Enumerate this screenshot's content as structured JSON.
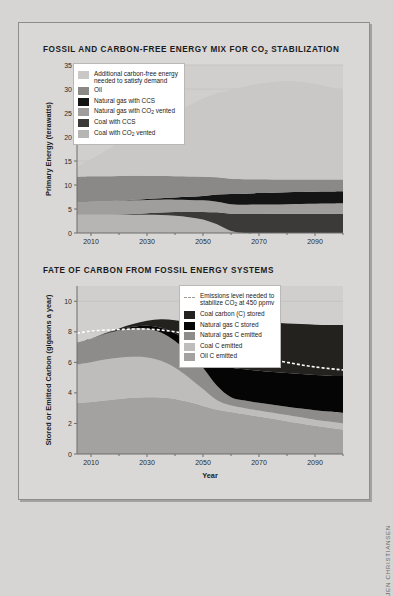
{
  "credit": "JEN CHRISTIANSEN",
  "panels": {
    "top": {
      "title_before": "FOSSIL AND CARBON-FREE ENERGY MIX FOR CO",
      "title_sub": "2",
      "title_after": " STABILIZATION"
    },
    "bottom": {
      "title_before": "FATE OF CARBON FROM FOSSIL ENERGY SYSTEMS",
      "title_sub": "",
      "title_after": ""
    }
  },
  "legend_top": [
    {
      "label_a": "Additional carbon-free energy",
      "label_b": "needed to satisfy demand",
      "color": "#c9c8c6",
      "type": "swatch"
    },
    {
      "label_a": "Oil",
      "label_b": "",
      "color": "#8a8987",
      "type": "swatch"
    },
    {
      "label_a": "Natural gas with CCS",
      "label_b": "",
      "color": "#141414",
      "type": "swatch"
    },
    {
      "label_a": "Natural gas with CO",
      "label_sub": "2",
      "label_a2": " vented",
      "label_b": "",
      "color": "#9f9e9c",
      "type": "swatch"
    },
    {
      "label_a": "Coal with CCS",
      "label_b": "",
      "color": "#3b3a38",
      "type": "swatch"
    },
    {
      "label_a": "Coal with CO",
      "label_sub": "2",
      "label_a2": " vented",
      "label_b": "",
      "color": "#b6b5b3",
      "type": "swatch"
    }
  ],
  "legend_bottom": [
    {
      "label_a": "Emissions level needed to",
      "label_b": "stabilize CO",
      "label_sub": "2",
      "label_b2": " at 450 ppmv",
      "color": "#9b9a98",
      "type": "dashline"
    },
    {
      "label_a": "Coal carbon (C) stored",
      "label_b": "",
      "color": "#23221f",
      "type": "swatch"
    },
    {
      "label_a": "Natural gas C stored",
      "label_b": "",
      "color": "#050505",
      "type": "swatch"
    },
    {
      "label_a": "Natural gas C emitted",
      "label_b": "",
      "color": "#8d8c8a",
      "type": "swatch"
    },
    {
      "label_a": "Coal C emitted",
      "label_b": "",
      "color": "#bebdbb",
      "type": "swatch"
    },
    {
      "label_a": "Oil C emitted",
      "label_b": "",
      "color": "#a3a2a0",
      "type": "swatch"
    }
  ],
  "chart_data": [
    {
      "id": "energy-mix",
      "type": "area",
      "title": "FOSSIL AND CARBON-FREE ENERGY MIX FOR CO2 STABILIZATION",
      "xlabel": "",
      "ylabel": "Primary Energy (terawatts)",
      "xlim": [
        2005,
        2100
      ],
      "ylim": [
        0,
        35
      ],
      "xticks": [
        2010,
        2030,
        2050,
        2070,
        2090
      ],
      "xminorticks": [
        2020,
        2040,
        2060,
        2080,
        2100
      ],
      "yticks": [
        0,
        5,
        10,
        15,
        20,
        25,
        30,
        35
      ],
      "grid": true,
      "legend_position": "upper-left",
      "stack_order": [
        "Coal with CO2 vented",
        "Coal with CCS",
        "Natural gas with CO2 vented",
        "Natural gas with CCS",
        "Oil",
        "Additional carbon-free energy needed to satisfy demand"
      ],
      "x": [
        2005,
        2010,
        2015,
        2020,
        2025,
        2030,
        2035,
        2040,
        2045,
        2050,
        2055,
        2060,
        2065,
        2070,
        2075,
        2080,
        2085,
        2090,
        2095,
        2100
      ],
      "series": [
        {
          "name": "Coal with CO2 vented",
          "color": "#b6b5b3",
          "values": [
            3.8,
            3.8,
            3.8,
            3.8,
            3.8,
            3.8,
            3.75,
            3.6,
            3.3,
            2.8,
            1.8,
            0.4,
            0.0,
            0.0,
            0.0,
            0.0,
            0.0,
            0.0,
            0.0,
            0.0
          ]
        },
        {
          "name": "Coal with CCS",
          "color": "#3b3a38",
          "values": [
            0.0,
            0.0,
            0.0,
            0.05,
            0.15,
            0.3,
            0.5,
            0.75,
            1.1,
            1.6,
            2.5,
            3.6,
            3.95,
            3.98,
            4.0,
            4.0,
            4.0,
            4.0,
            4.0,
            4.0
          ]
        },
        {
          "name": "Natural gas with CO2 vented",
          "color": "#9f9e9c",
          "values": [
            2.6,
            2.7,
            2.8,
            2.85,
            2.85,
            2.8,
            2.7,
            2.6,
            2.5,
            2.4,
            2.2,
            2.0,
            1.95,
            1.95,
            1.95,
            2.0,
            2.05,
            2.1,
            2.15,
            2.2
          ]
        },
        {
          "name": "Natural gas with CCS",
          "color": "#141414",
          "values": [
            0.0,
            0.0,
            0.0,
            0.05,
            0.12,
            0.2,
            0.3,
            0.45,
            0.65,
            0.9,
            1.5,
            2.1,
            2.3,
            2.4,
            2.45,
            2.5,
            2.5,
            2.5,
            2.5,
            2.5
          ]
        },
        {
          "name": "Oil",
          "color": "#8a8987",
          "values": [
            5.3,
            5.3,
            5.2,
            5.1,
            5.0,
            4.8,
            4.6,
            4.4,
            4.2,
            4.0,
            3.6,
            3.2,
            3.0,
            2.85,
            2.75,
            2.65,
            2.6,
            2.55,
            2.5,
            2.45
          ]
        },
        {
          "name": "Additional carbon-free energy needed to satisfy demand",
          "color": "#c9c8c6",
          "values": [
            2.1,
            3.6,
            5.3,
            7.0,
            8.6,
            10.1,
            11.6,
            13.2,
            14.8,
            16.3,
            17.5,
            18.5,
            19.3,
            19.9,
            20.3,
            20.5,
            20.3,
            19.9,
            19.3,
            18.5
          ]
        }
      ]
    },
    {
      "id": "carbon-fate",
      "type": "area",
      "title": "FATE OF CARBON FROM FOSSIL ENERGY SYSTEMS",
      "xlabel": "Year",
      "ylabel": "Stored or Emitted Carbon (gigatons a year)",
      "xlim": [
        2005,
        2100
      ],
      "ylim": [
        0,
        11
      ],
      "xticks": [
        2010,
        2030,
        2050,
        2070,
        2090
      ],
      "xminorticks": [
        2020,
        2040,
        2060,
        2080,
        2100
      ],
      "yticks": [
        0,
        2,
        4,
        6,
        8,
        10
      ],
      "grid": true,
      "legend_position": "upper-right",
      "stack_order": [
        "Oil C emitted",
        "Coal C emitted",
        "Natural gas C emitted",
        "Natural gas C stored",
        "Coal carbon (C) stored"
      ],
      "x": [
        2005,
        2010,
        2015,
        2020,
        2025,
        2030,
        2035,
        2040,
        2045,
        2050,
        2055,
        2060,
        2065,
        2070,
        2075,
        2080,
        2085,
        2090,
        2095,
        2100
      ],
      "series": [
        {
          "name": "Oil C emitted",
          "color": "#a3a2a0",
          "values": [
            3.35,
            3.4,
            3.5,
            3.6,
            3.68,
            3.72,
            3.7,
            3.6,
            3.4,
            3.15,
            2.9,
            2.75,
            2.6,
            2.45,
            2.3,
            2.15,
            2.0,
            1.85,
            1.72,
            1.6
          ]
        },
        {
          "name": "Coal C emitted",
          "color": "#bebdbb",
          "values": [
            2.5,
            2.6,
            2.68,
            2.7,
            2.68,
            2.6,
            2.4,
            2.05,
            1.6,
            1.1,
            0.62,
            0.42,
            0.4,
            0.4,
            0.4,
            0.4,
            0.4,
            0.4,
            0.4,
            0.4
          ]
        },
        {
          "name": "Natural gas C emitted",
          "color": "#8d8c8a",
          "values": [
            1.45,
            1.55,
            1.68,
            1.78,
            1.85,
            1.88,
            1.85,
            1.75,
            1.6,
            1.4,
            0.95,
            0.55,
            0.5,
            0.5,
            0.52,
            0.55,
            0.58,
            0.62,
            0.66,
            0.7
          ]
        },
        {
          "name": "Natural gas C stored",
          "color": "#050505",
          "values": [
            0.0,
            0.0,
            0.02,
            0.06,
            0.12,
            0.2,
            0.32,
            0.5,
            0.75,
            1.05,
            1.55,
            1.95,
            2.05,
            2.1,
            2.15,
            2.2,
            2.25,
            2.3,
            2.35,
            2.4
          ]
        },
        {
          "name": "Coal carbon (C) stored",
          "color": "#23221f",
          "values": [
            0.0,
            0.0,
            0.02,
            0.08,
            0.18,
            0.32,
            0.55,
            0.85,
            1.25,
            1.75,
            2.45,
            3.05,
            3.15,
            3.2,
            3.22,
            3.25,
            3.28,
            3.3,
            3.32,
            3.35
          ]
        }
      ],
      "reference_line": {
        "name": "Emissions level needed to stabilize CO2 at 450 ppmv",
        "color": "#ffffff",
        "style": "dashed",
        "x": [
          2005,
          2010,
          2020,
          2030,
          2040,
          2050,
          2055,
          2060,
          2070,
          2080,
          2090,
          2100
        ],
        "values": [
          7.9,
          8.05,
          8.15,
          8.18,
          8.0,
          7.6,
          7.2,
          6.8,
          6.35,
          6.0,
          5.7,
          5.5
        ]
      }
    }
  ]
}
